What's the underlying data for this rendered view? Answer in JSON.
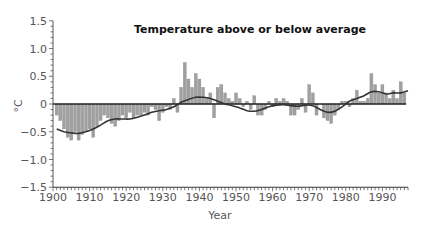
{
  "chart_data": {
    "type": "bar",
    "title": "Temperature above or below average",
    "xlabel": "Year",
    "ylabel": "°C",
    "ylim": [
      -1.5,
      1.5
    ],
    "xlim": [
      1900,
      1997
    ],
    "yticks": [
      1.5,
      1.0,
      0.5,
      0,
      -0.5,
      -1.0,
      -1.5
    ],
    "ytick_labels": [
      "1.5",
      "1.0",
      "0.5",
      "0",
      "−0.5",
      "−1.0",
      "−1.5"
    ],
    "xticks": [
      1900,
      1910,
      1920,
      1930,
      1940,
      1950,
      1960,
      1970,
      1980,
      1990
    ],
    "xtick_labels": [
      "1900",
      "1910",
      "1920",
      "1930",
      "1940",
      "1950",
      "1960",
      "1970",
      "1980",
      "1990"
    ],
    "grid": false,
    "legend": null,
    "colors": {
      "bars": "#a0a0a0",
      "bar_edge": "#8a8a8a",
      "trend": "#333333",
      "axis": "#222222"
    },
    "series": [
      {
        "name": "Annual anomaly",
        "type": "bar",
        "x": [
          1901,
          1902,
          1903,
          1904,
          1905,
          1906,
          1907,
          1908,
          1909,
          1910,
          1911,
          1912,
          1913,
          1914,
          1915,
          1916,
          1917,
          1918,
          1919,
          1920,
          1921,
          1922,
          1923,
          1924,
          1925,
          1926,
          1927,
          1928,
          1929,
          1930,
          1931,
          1932,
          1933,
          1934,
          1935,
          1936,
          1937,
          1938,
          1939,
          1940,
          1941,
          1942,
          1943,
          1944,
          1945,
          1946,
          1947,
          1948,
          1949,
          1950,
          1951,
          1952,
          1953,
          1954,
          1955,
          1956,
          1957,
          1958,
          1959,
          1960,
          1961,
          1962,
          1963,
          1964,
          1965,
          1966,
          1967,
          1968,
          1969,
          1970,
          1971,
          1972,
          1973,
          1974,
          1975,
          1976,
          1977,
          1978,
          1979,
          1980,
          1981,
          1982,
          1983,
          1984,
          1985,
          1986,
          1987,
          1988,
          1989,
          1990,
          1991,
          1992,
          1993,
          1994,
          1995,
          1996
        ],
        "values": [
          -0.2,
          -0.3,
          -0.45,
          -0.6,
          -0.65,
          -0.5,
          -0.65,
          -0.55,
          -0.5,
          -0.45,
          -0.6,
          -0.4,
          -0.3,
          -0.2,
          -0.25,
          -0.35,
          -0.4,
          -0.3,
          -0.2,
          -0.25,
          -0.15,
          -0.25,
          -0.2,
          -0.2,
          -0.15,
          -0.2,
          -0.05,
          -0.1,
          -0.3,
          -0.15,
          -0.05,
          -0.1,
          0.1,
          -0.15,
          0.3,
          0.75,
          0.45,
          0.3,
          0.55,
          0.45,
          0.3,
          0.1,
          0.2,
          -0.25,
          0.3,
          0.35,
          0.2,
          0.1,
          0.05,
          0.2,
          0.1,
          -0.05,
          0.05,
          -0.1,
          0.15,
          -0.2,
          -0.2,
          -0.1,
          0.05,
          -0.05,
          0.1,
          0.05,
          0.1,
          0.05,
          -0.2,
          -0.2,
          -0.1,
          0.1,
          -0.15,
          0.35,
          0.2,
          -0.2,
          0.0,
          -0.25,
          -0.3,
          -0.35,
          -0.2,
          -0.1,
          0.05,
          0.05,
          -0.05,
          0.1,
          0.25,
          0.05,
          0.05,
          0.1,
          0.55,
          0.35,
          0.2,
          0.35,
          0.2,
          0.1,
          0.25,
          0.1,
          0.4,
          0.2
        ]
      },
      {
        "name": "Smoothed trend",
        "type": "line",
        "x": [
          1901,
          1903,
          1905,
          1907,
          1909,
          1911,
          1913,
          1915,
          1917,
          1919,
          1921,
          1923,
          1925,
          1927,
          1929,
          1931,
          1933,
          1935,
          1937,
          1939,
          1941,
          1943,
          1945,
          1947,
          1949,
          1951,
          1953,
          1955,
          1957,
          1959,
          1961,
          1963,
          1965,
          1967,
          1969,
          1971,
          1973,
          1975,
          1977,
          1979,
          1981,
          1983,
          1985,
          1987,
          1989,
          1991,
          1993,
          1995,
          1997
        ],
        "values": [
          -0.45,
          -0.5,
          -0.52,
          -0.53,
          -0.5,
          -0.45,
          -0.38,
          -0.3,
          -0.27,
          -0.27,
          -0.27,
          -0.24,
          -0.2,
          -0.15,
          -0.12,
          -0.1,
          -0.05,
          0.03,
          0.08,
          0.12,
          0.12,
          0.1,
          0.05,
          0.0,
          -0.03,
          -0.07,
          -0.12,
          -0.13,
          -0.1,
          -0.05,
          -0.02,
          -0.01,
          -0.03,
          -0.04,
          -0.02,
          -0.03,
          -0.1,
          -0.15,
          -0.13,
          -0.05,
          0.05,
          0.1,
          0.15,
          0.22,
          0.22,
          0.18,
          0.2,
          0.2,
          0.24
        ]
      }
    ]
  }
}
